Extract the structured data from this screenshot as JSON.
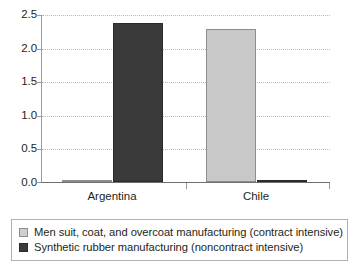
{
  "chart_data": {
    "type": "bar",
    "title": "",
    "xlabel": "",
    "ylabel": "",
    "categories": [
      "Argentina",
      "Chile"
    ],
    "series": [
      {
        "name": "Men suit, coat, and overcoat manufacturing (contract intensive)",
        "color": "#c8c8c8",
        "values": [
          0.03,
          2.29
        ]
      },
      {
        "name": "Synthetic rubber manufacturing (noncontract intensive)",
        "color": "#3a3a3a",
        "values": [
          2.38,
          0.03
        ]
      }
    ],
    "ylim": [
      0.0,
      2.5
    ],
    "y_ticks": [
      "0.0",
      "0.5",
      "1.0",
      "1.5",
      "2.0",
      "2.5"
    ],
    "y_tick_values": [
      0.0,
      0.5,
      1.0,
      1.5,
      2.0,
      2.5
    ],
    "grid": true,
    "grid_axis": "y",
    "grid_style": "dotted",
    "legend_position": "bottom"
  },
  "legend": {
    "entries": [
      {
        "label": "Men suit, coat, and overcoat manufacturing (contract intensive)",
        "swatch": "light-square-swatch"
      },
      {
        "label": "Synthetic rubber manufacturing (noncontract intensive)",
        "swatch": "dark-square-swatch"
      }
    ]
  }
}
